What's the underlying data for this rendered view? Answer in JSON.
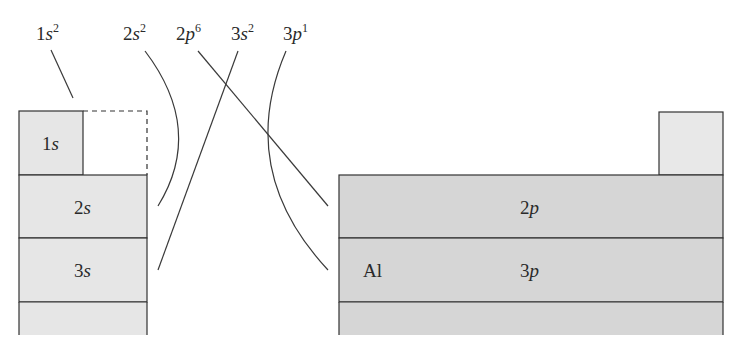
{
  "diagram": {
    "configuration_labels": [
      {
        "n": "1",
        "l": "s",
        "e": "2"
      },
      {
        "n": "2",
        "l": "s",
        "e": "2"
      },
      {
        "n": "2",
        "l": "p",
        "e": "6"
      },
      {
        "n": "3",
        "l": "s",
        "e": "2"
      },
      {
        "n": "3",
        "l": "p",
        "e": "1"
      }
    ],
    "s_bands": {
      "b1": {
        "n": "1",
        "l": "s"
      },
      "b2": {
        "n": "2",
        "l": "s"
      },
      "b3": {
        "n": "3",
        "l": "s"
      }
    },
    "p_bands": {
      "b2": {
        "n": "2",
        "l": "p"
      },
      "b3": {
        "n": "3",
        "l": "p"
      }
    },
    "element": "Al",
    "colors": {
      "s_fill": "#e6e6e6",
      "p_fill": "#d6d6d6",
      "stroke": "#333333",
      "line": "#3a3a3a"
    }
  }
}
